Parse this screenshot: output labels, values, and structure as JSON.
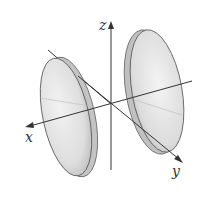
{
  "figure": {
    "axes": {
      "x_label": "x",
      "y_label": "y",
      "z_label": "z"
    },
    "colors": {
      "background": "#ffffff",
      "axis": "#333333",
      "surface_fill": "#dcdcdc",
      "surface_edge": "#555555"
    }
  }
}
